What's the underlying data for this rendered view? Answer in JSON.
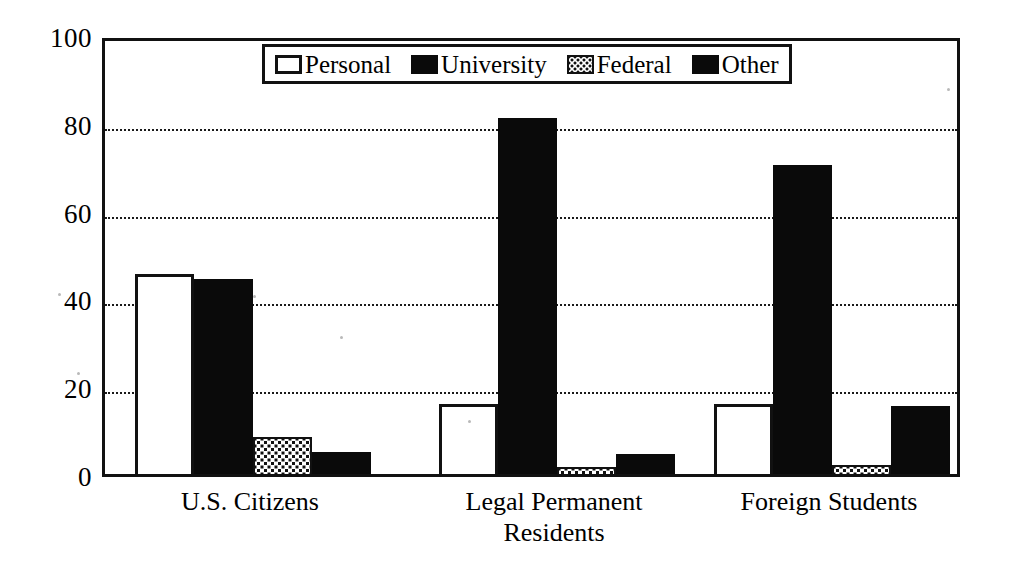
{
  "chart_data": {
    "type": "bar",
    "title": "",
    "xlabel": "",
    "ylabel": "",
    "ylim": [
      0,
      100
    ],
    "yticks": [
      0,
      20,
      40,
      60,
      80,
      100
    ],
    "ytick_labels": [
      "0",
      "20",
      "40",
      "60",
      "80",
      "100"
    ],
    "grid": true,
    "legend_position": "top-center",
    "categories": [
      "U.S. Citizens",
      "Legal Permanent\nResidents",
      "Foreign Students"
    ],
    "series": [
      {
        "name": "Personal",
        "swatch": "white-outline",
        "values": [
          45.5,
          16.0,
          16.0
        ]
      },
      {
        "name": "University",
        "swatch": "solid-black",
        "values": [
          44.5,
          81.0,
          70.5
        ]
      },
      {
        "name": "Federal",
        "swatch": "stippled",
        "values": [
          8.5,
          1.5,
          2.0
        ]
      },
      {
        "name": "Other",
        "swatch": "solid-black",
        "values": [
          5.0,
          4.5,
          15.5
        ]
      }
    ],
    "colors": {
      "axis": "#111111",
      "solid_black": "#0a0a0a",
      "white_fill": "#ffffff",
      "grid": "#1a1a1a"
    }
  }
}
